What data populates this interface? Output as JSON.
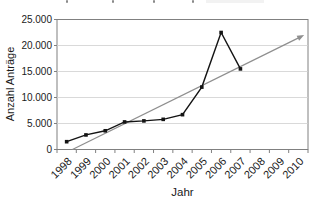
{
  "window": {
    "width": 319,
    "height": 207
  },
  "chart_data": {
    "type": "line",
    "categories": [
      "1998",
      "1999",
      "2000",
      "2001",
      "2002",
      "2003",
      "2004",
      "2005",
      "2006",
      "2007",
      "2008",
      "2009",
      "2010"
    ],
    "series": [
      {
        "name": "Anzahl Anträge",
        "values": [
          1500,
          2800,
          3600,
          5300,
          5500,
          5800,
          6700,
          12000,
          22500,
          15500,
          null,
          null,
          null
        ],
        "color": "#141414",
        "marker": "square"
      }
    ],
    "trend_arrow": {
      "start_year": 1998.3,
      "start_value": 0,
      "end_year": 2010.3,
      "end_value": 22000,
      "color": "#8f8f8f"
    },
    "xlabel": "Jahr",
    "ylabel": "Anzahl Anträge",
    "ylim": [
      0,
      25000
    ],
    "ytick_step": 5000,
    "ytick_labels": [
      "0",
      "5.000",
      "10.000",
      "15.000",
      "20.000",
      "25.000"
    ],
    "grid": true,
    "legend": "none",
    "number_format": "de-thousands-dot"
  },
  "colors": {
    "background": "#ffffff",
    "plot_border": "#808080",
    "gridline": "#d9d9d9",
    "tick": "#808080",
    "text": "#1a1a1a"
  }
}
